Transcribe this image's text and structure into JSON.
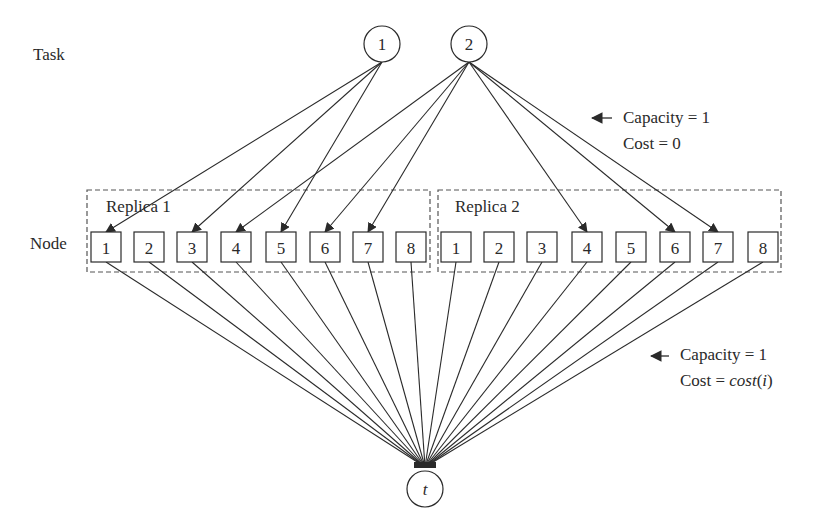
{
  "labels": {
    "task": "Task",
    "node": "Node",
    "replica1": "Replica 1",
    "replica2": "Replica 2"
  },
  "tasks": [
    {
      "id": "1",
      "label": "1",
      "cx": 382,
      "cy": 44
    },
    {
      "id": "2",
      "label": "2",
      "cx": 469,
      "cy": 44
    }
  ],
  "sink": {
    "label": "t",
    "cx": 425,
    "cy": 489
  },
  "replicas": [
    {
      "name": "Replica 1",
      "nodes": [
        {
          "label": "1",
          "cx": 106
        },
        {
          "label": "2",
          "cx": 149
        },
        {
          "label": "3",
          "cx": 192
        },
        {
          "label": "4",
          "cx": 236
        },
        {
          "label": "5",
          "cx": 281
        },
        {
          "label": "6",
          "cx": 325
        },
        {
          "label": "7",
          "cx": 368
        },
        {
          "label": "8",
          "cx": 411
        }
      ]
    },
    {
      "name": "Replica 2",
      "nodes": [
        {
          "label": "1",
          "cx": 456
        },
        {
          "label": "2",
          "cx": 499
        },
        {
          "label": "3",
          "cx": 542
        },
        {
          "label": "4",
          "cx": 587
        },
        {
          "label": "5",
          "cx": 631
        },
        {
          "label": "6",
          "cx": 675
        },
        {
          "label": "7",
          "cx": 718
        },
        {
          "label": "8",
          "cx": 763
        }
      ]
    }
  ],
  "task_edges": [
    {
      "from": "1",
      "to_replica": 1,
      "to_node": "1"
    },
    {
      "from": "1",
      "to_replica": 1,
      "to_node": "3"
    },
    {
      "from": "1",
      "to_replica": 1,
      "to_node": "5"
    },
    {
      "from": "2",
      "to_replica": 1,
      "to_node": "4"
    },
    {
      "from": "2",
      "to_replica": 1,
      "to_node": "6"
    },
    {
      "from": "2",
      "to_replica": 1,
      "to_node": "7"
    },
    {
      "from": "2",
      "to_replica": 2,
      "to_node": "4"
    },
    {
      "from": "2",
      "to_replica": 2,
      "to_node": "6"
    },
    {
      "from": "2",
      "to_replica": 2,
      "to_node": "7"
    }
  ],
  "annotations": {
    "top": {
      "capacity": "Capacity = 1",
      "cost": "Cost = 0"
    },
    "bottom": {
      "capacity": "Capacity = 1",
      "cost_prefix": "Cost = ",
      "cost_italic": "cost",
      "cost_paren_open": "(",
      "cost_var": "i",
      "cost_paren_close": ")"
    }
  },
  "colors": {
    "stroke": "#2a2a2a",
    "dash": "#555555",
    "background": "#ffffff"
  }
}
